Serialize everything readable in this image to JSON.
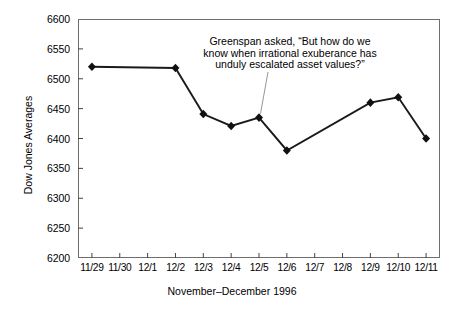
{
  "chart_data": {
    "type": "line",
    "title": "",
    "xlabel": "November–December 1996",
    "ylabel": "Dow Jones Averages",
    "ylim": [
      6200,
      6600
    ],
    "ytick_step": 50,
    "yticks": [
      6600,
      6550,
      6500,
      6450,
      6400,
      6350,
      6300,
      6250,
      6200
    ],
    "categories": [
      "11/29",
      "11/30",
      "12/1",
      "12/2",
      "12/3",
      "12/4",
      "12/5",
      "12/6",
      "12/7",
      "12/8",
      "12/9",
      "12/10",
      "12/11"
    ],
    "values": [
      6520,
      null,
      null,
      6518,
      6441,
      6421,
      6435,
      6380,
      null,
      null,
      6460,
      6469,
      6400
    ],
    "grid": false,
    "legend": false,
    "marker": "diamond",
    "line_color": "#1a1a1a",
    "marker_color": "#111111",
    "annotations": [
      {
        "text": "Greenspan asked, “But how do we\nknow when irrational exuberance has\nunduly escalated asset values?”",
        "points_to_category": "12/5",
        "points_to_value": 6435
      }
    ]
  },
  "axes": {
    "y_title": "Dow Jones Averages",
    "x_title": "November–December 1996",
    "y_labels": [
      "6600",
      "6550",
      "6500",
      "6450",
      "6400",
      "6350",
      "6300",
      "6250",
      "6200"
    ],
    "x_labels": [
      "11/29",
      "11/30",
      "12/1",
      "12/2",
      "12/3",
      "12/4",
      "12/5",
      "12/6",
      "12/7",
      "12/8",
      "12/9",
      "12/10",
      "12/11"
    ]
  },
  "annotation": {
    "line1": "Greenspan asked, “But how do we",
    "line2": "know when irrational exuberance has",
    "line3": "unduly escalated asset values?”",
    "full": "Greenspan asked, “But how do we\nknow when irrational exuberance has\nunduly escalated asset values?”"
  },
  "colors": {
    "series": "#1a1a1a",
    "frame": "#6e6e6e",
    "background": "#ffffff",
    "leader": "#8a8a8a"
  }
}
